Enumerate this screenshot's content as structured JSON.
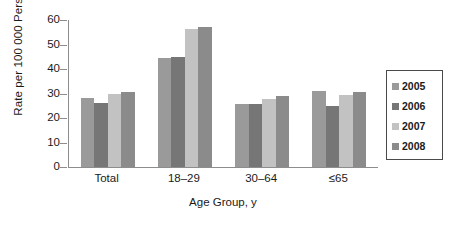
{
  "chart_data": {
    "type": "bar",
    "title": "",
    "xlabel": "Age Group, y",
    "ylabel": "Rate per 100 000 Person Years",
    "categories": [
      "Total",
      "18–29",
      "30–64",
      "≤65"
    ],
    "series": [
      {
        "name": "2005",
        "color": "#9a9a9a",
        "values": [
          28.2,
          44.6,
          25.6,
          31.2
        ]
      },
      {
        "name": "2006",
        "color": "#767676",
        "values": [
          26.3,
          45.1,
          25.6,
          25.1
        ]
      },
      {
        "name": "2007",
        "color": "#c2c2c2",
        "values": [
          29.6,
          56.2,
          27.6,
          29.4
        ]
      },
      {
        "name": "2008",
        "color": "#8b8b8b",
        "values": [
          30.6,
          57.2,
          28.9,
          30.6
        ]
      }
    ],
    "ylim": [
      0,
      60
    ],
    "yticks": [
      0,
      10,
      20,
      30,
      40,
      50,
      60
    ],
    "ytick_labels": [
      "0",
      "10",
      "20",
      "30",
      "40",
      "50",
      "60"
    ],
    "grid": false,
    "legend_position": "right-outside",
    "axis_color": "#8d8d8d"
  }
}
